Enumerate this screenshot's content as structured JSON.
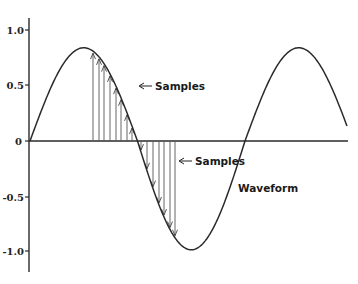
{
  "diagram": {
    "y_axis": {
      "ticks": [
        {
          "label": "1.0",
          "value": 1.0
        },
        {
          "label": "0.5",
          "value": 0.5
        },
        {
          "label": "0",
          "value": 0
        },
        {
          "label": "-0.5",
          "value": -0.5
        },
        {
          "label": "-1.0",
          "value": -1.0
        }
      ]
    },
    "annotations": {
      "samples_upper": "Samples",
      "samples_lower": "Samples",
      "waveform": "Waveform"
    },
    "colors": {
      "line": "#2a2a2a",
      "stem": "#555555",
      "text": "#1a1a1a"
    }
  },
  "chart_data": {
    "type": "line",
    "title": "",
    "xlabel": "",
    "ylabel": "",
    "ylim": [
      -1.2,
      1.15
    ],
    "series": [
      {
        "name": "Waveform",
        "description": "sine wave, ~1.5 cycles",
        "peak": 0.84,
        "trough": -0.98
      },
      {
        "name": "Samples (positive half)",
        "x_px": [
          93,
          99,
          104,
          110,
          116,
          121,
          127,
          132
        ]
      },
      {
        "name": "Samples (negative half)",
        "x_px": [
          141,
          147,
          153,
          159,
          164,
          170,
          175
        ]
      }
    ],
    "legend": [
      "Samples",
      "Samples",
      "Waveform"
    ],
    "grid": false
  }
}
